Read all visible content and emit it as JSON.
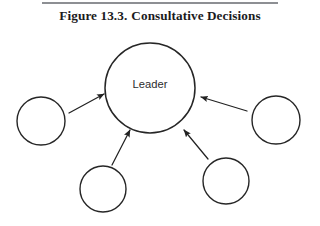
{
  "figure": {
    "caption_number": "Figure 13.3.",
    "caption_title": "Consultative Decisions",
    "caption_full": "Figure 13.3.  Consultative Decisions",
    "background_color": "#ffffff",
    "rule_color": "#8d8f93",
    "stroke_color": "#262626",
    "text_color": "#1b1b1d"
  },
  "diagram": {
    "type": "hub-and-spoke",
    "center_node": {
      "id": "leader",
      "label": "Leader",
      "cx": 150,
      "cy": 88,
      "r": 45,
      "stroke_width": 1.5
    },
    "peripheral_nodes": [
      {
        "id": "member-left",
        "label": "",
        "cx": 41,
        "cy": 121,
        "r": 24,
        "stroke_width": 1.4
      },
      {
        "id": "member-right",
        "label": "",
        "cx": 276,
        "cy": 120,
        "r": 24,
        "stroke_width": 1.4
      },
      {
        "id": "member-bottom-left",
        "label": "",
        "cx": 103,
        "cy": 189,
        "r": 23,
        "stroke_width": 1.4
      },
      {
        "id": "member-bottom-right",
        "label": "",
        "cx": 226,
        "cy": 181,
        "r": 23,
        "stroke_width": 1.4
      }
    ],
    "arrows": [
      {
        "id": "arrow-left-to-leader",
        "from": "member-left",
        "to": "leader",
        "x1": 69,
        "y1": 113,
        "x2": 104,
        "y2": 94,
        "direction": "up-right"
      },
      {
        "id": "arrow-right-to-leader",
        "from": "member-right",
        "to": "leader",
        "x1": 247,
        "y1": 111,
        "x2": 201,
        "y2": 97,
        "direction": "up-left"
      },
      {
        "id": "arrow-bottom-left-to-leader",
        "from": "member-bottom-left",
        "to": "leader",
        "x1": 112,
        "y1": 165,
        "x2": 130,
        "y2": 130,
        "direction": "up-right"
      },
      {
        "id": "arrow-bottom-right-to-leader",
        "from": "member-bottom-right",
        "to": "leader",
        "x1": 208,
        "y1": 159,
        "x2": 184,
        "y2": 130,
        "direction": "up-left"
      }
    ]
  }
}
